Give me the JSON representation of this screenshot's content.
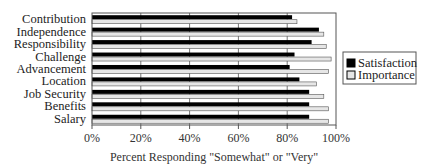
{
  "chart_data": {
    "type": "bar",
    "orientation": "horizontal",
    "title": "",
    "xlabel": "Percent Responding \"Somewhat\" or \"Very\"",
    "ylabel": "",
    "xlim": [
      0,
      100
    ],
    "x_ticks": [
      "0%",
      "20%",
      "40%",
      "60%",
      "80%",
      "100%"
    ],
    "grid": "vertical",
    "legend_position": "right",
    "categories": [
      "Contribution",
      "Independence",
      "Responsibility",
      "Challenge",
      "Advancement",
      "Location",
      "Job Security",
      "Benefits",
      "Salary"
    ],
    "series": [
      {
        "name": "Satisfaction",
        "color": "#000000",
        "values": [
          82,
          93,
          90,
          83,
          81,
          85,
          89,
          89,
          89
        ]
      },
      {
        "name": "Importance",
        "color": "#e6e6e6",
        "values": [
          84,
          95,
          96,
          98,
          97,
          92,
          95,
          97,
          97
        ]
      }
    ]
  }
}
